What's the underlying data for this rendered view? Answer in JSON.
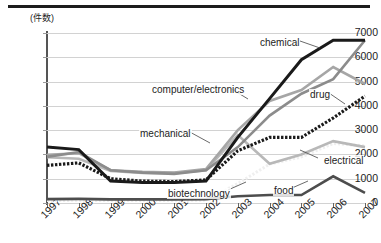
{
  "chart_data": {
    "type": "line",
    "title": "",
    "subtitle": "",
    "unit_label": "(件数)",
    "xlabel": "",
    "ylabel": "",
    "grid": true,
    "legend_position": "inline-annotations",
    "categories": [
      "1997",
      "1998",
      "1999",
      "2000",
      "2001",
      "2002",
      "2003",
      "2004",
      "2005",
      "2006",
      "2007"
    ],
    "ylim": [
      0,
      7000
    ],
    "ytick_labels": [
      "0",
      "1000",
      "2000",
      "3000",
      "4000",
      "5000",
      "6000",
      "7000"
    ],
    "ytick_values": [
      0,
      1000,
      2000,
      3000,
      4000,
      5000,
      6000,
      7000
    ],
    "series": [
      {
        "name": "chemical",
        "style": "solid-thick-black",
        "color": "#1a1a1a",
        "values": [
          2300,
          2200,
          900,
          850,
          850,
          900,
          2700,
          4300,
          5900,
          6700,
          6700
        ]
      },
      {
        "name": "computer/electronics",
        "style": "solid-medium-gray",
        "color": "#8c8c8c",
        "values": [
          1900,
          2100,
          1350,
          1250,
          1200,
          1350,
          2300,
          3600,
          4500,
          5100,
          6700
        ]
      },
      {
        "name": "mechanical",
        "style": "solid-gray",
        "color": "#a6a6a6",
        "values": [
          1980,
          2050,
          1350,
          1280,
          1250,
          1400,
          3000,
          4200,
          4650,
          5600,
          4900
        ]
      },
      {
        "name": "drug",
        "style": "dotted-thick-black",
        "color": "#1a1a1a",
        "values": [
          1550,
          1650,
          1000,
          900,
          880,
          950,
          2150,
          2700,
          2700,
          3500,
          4400
        ]
      },
      {
        "name": "electrical",
        "style": "solid-light-gray",
        "color": "#b8b8b8",
        "values": [
          1880,
          1820,
          1320,
          1240,
          1230,
          1350,
          2800,
          1620,
          2000,
          2550,
          2300
        ]
      },
      {
        "name": "biotechnology",
        "style": "dotted-white",
        "color": "#efefef",
        "values": [
          100,
          110,
          100,
          100,
          100,
          120,
          800,
          1600,
          1900,
          2450,
          2350
        ]
      },
      {
        "name": "food",
        "style": "solid-dark-gray",
        "color": "#4d4d4d",
        "values": [
          160,
          170,
          150,
          150,
          150,
          160,
          280,
          330,
          330,
          1100,
          420
        ]
      }
    ],
    "annotations": [
      {
        "label": "chemical",
        "x": 259,
        "y": 37
      },
      {
        "label": "computer/electronics",
        "x": 151,
        "y": 84
      },
      {
        "label": "drug",
        "x": 309,
        "y": 89
      },
      {
        "label": "mechanical",
        "x": 139,
        "y": 128
      },
      {
        "label": "electrical",
        "x": 323,
        "y": 155
      },
      {
        "label": "biotechnology",
        "x": 167,
        "y": 188
      },
      {
        "label": "food",
        "x": 273,
        "y": 185
      }
    ]
  }
}
